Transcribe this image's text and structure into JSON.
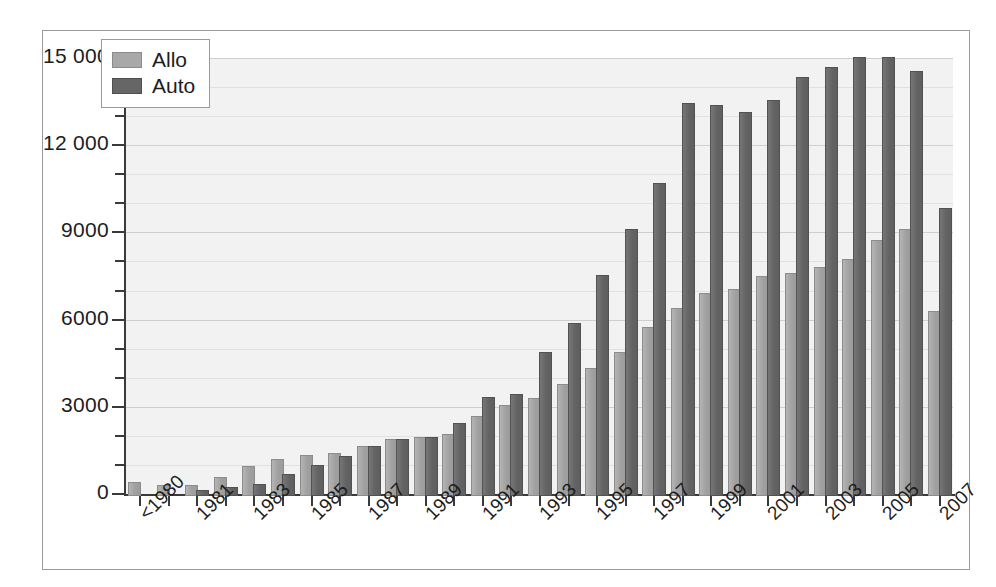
{
  "chart_data": {
    "type": "bar",
    "title": "",
    "subtitle": "",
    "xlabel": "",
    "ylabel": "",
    "ylim": [
      0,
      15000
    ],
    "y_ticks_major": [
      0,
      3000,
      6000,
      9000,
      12000,
      15000
    ],
    "y_tick_labels": [
      "0",
      "3000",
      "6000",
      "9000",
      "12 000",
      "15 000"
    ],
    "y_minor_step": 1000,
    "grid": true,
    "legend_position": "top-left",
    "categories": [
      "<1980",
      "1980",
      "1981",
      "1982",
      "1983",
      "1984",
      "1985",
      "1986",
      "1987",
      "1988",
      "1989",
      "1990",
      "1991",
      "1992",
      "1993",
      "1994",
      "1995",
      "1996",
      "1997",
      "1998",
      "1999",
      "2000",
      "2001",
      "2002",
      "2003",
      "2004",
      "2005",
      "2006",
      "2007"
    ],
    "tick_labels": [
      "<1980",
      "",
      "1981",
      "",
      "1983",
      "",
      "1985",
      "",
      "1987",
      "",
      "1989",
      "",
      "1991",
      "",
      "1993",
      "",
      "1995",
      "",
      "1997",
      "",
      "1999",
      "",
      "2001",
      "",
      "2003",
      "",
      "2005",
      "",
      "2007"
    ],
    "series": [
      {
        "name": "Allo",
        "color": "#a8a8a8",
        "values": [
          400,
          300,
          300,
          600,
          950,
          1200,
          1350,
          1400,
          1650,
          1900,
          1950,
          2050,
          2700,
          3050,
          3300,
          3800,
          4350,
          4900,
          5750,
          6400,
          6900,
          7050,
          7500,
          7600,
          7800,
          8100,
          8750,
          9100,
          6300
        ]
      },
      {
        "name": "Auto",
        "color": "#666666",
        "values": [
          0,
          0,
          150,
          250,
          350,
          700,
          1000,
          1300,
          1650,
          1900,
          1950,
          2450,
          3350,
          3450,
          4900,
          5900,
          7550,
          9100,
          10700,
          13450,
          13400,
          13150,
          13550,
          14350,
          14700,
          15050,
          15050,
          14550,
          9850
        ]
      }
    ]
  },
  "legend": {
    "items": [
      {
        "label": "Allo",
        "swatch": "allo"
      },
      {
        "label": "Auto",
        "swatch": "auto"
      }
    ]
  }
}
